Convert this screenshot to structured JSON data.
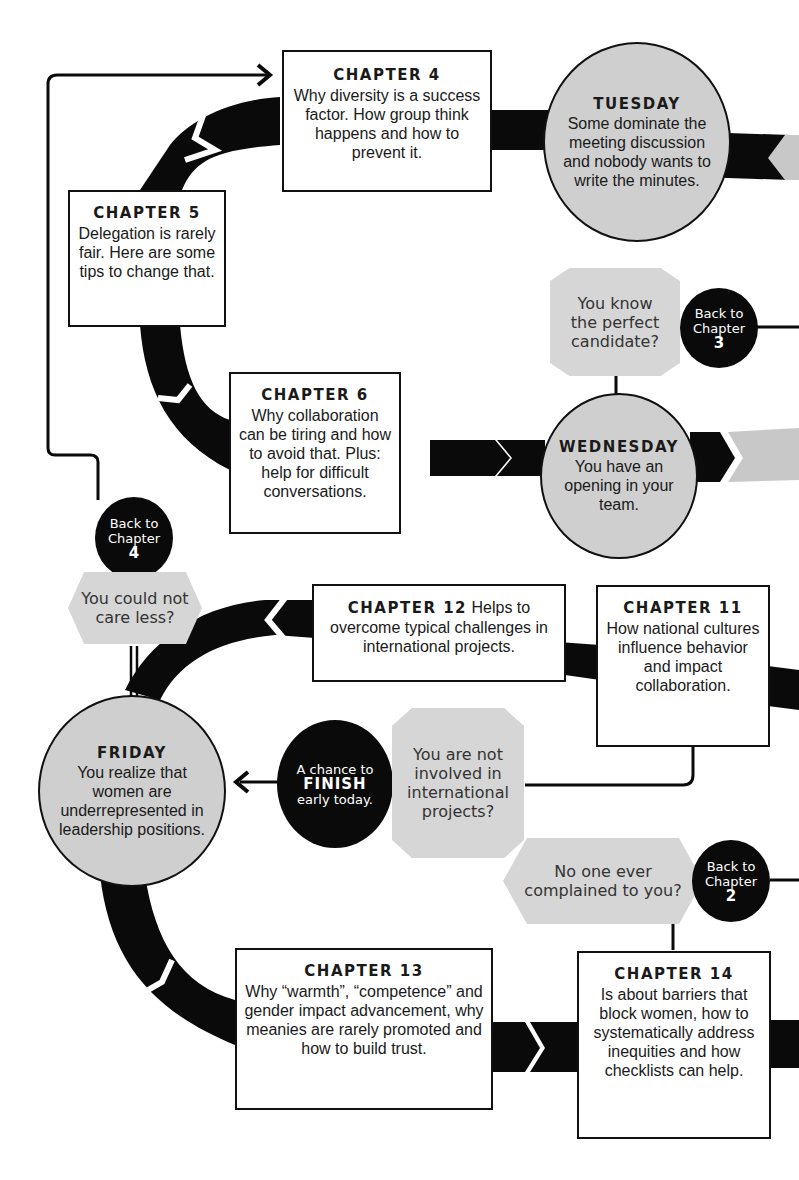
{
  "chapters": {
    "ch4": {
      "title": "CHAPTER 4",
      "text": "Why diversity is a success factor. How group think happens and how to prevent it."
    },
    "ch5": {
      "title": "CHAPTER 5",
      "text": "Delegation is rarely fair. Here are some tips to change that."
    },
    "ch6": {
      "title": "CHAPTER 6",
      "text": "Why collaboration can be tiring and how to avoid that. Plus: help for difficult conversations."
    },
    "ch11": {
      "title": "CHAPTER 11",
      "text": "How national cultures influence behavior and impact collaboration."
    },
    "ch12": {
      "title": "CHAPTER 12",
      "text": "Helps to overcome typical challenges in international projects."
    },
    "ch13": {
      "title": "CHAPTER 13",
      "text": "Why “warmth”, “competence” and gender impact advancement, why meanies are rarely promoted and how to build trust."
    },
    "ch14": {
      "title": "CHAPTER 14",
      "text": "Is about barriers that block women, how to systematically address inequities and how checklists can help."
    }
  },
  "days": {
    "tuesday": {
      "title": "TUESDAY",
      "text": "Some dominate the meeting discussion and nobody wants to write the minutes."
    },
    "wednesday": {
      "title": "WEDNESDAY",
      "text": "You have an opening in your team."
    },
    "friday": {
      "title": "FRIDAY",
      "text": "You realize that women are underrepresented in leadership positions."
    }
  },
  "questions": {
    "perfect_candidate": "You know the perfect candidate?",
    "could_not_care": "You could not care less?",
    "not_international": "You are not involved in international projects?",
    "no_complaints": "No one ever complained to you?"
  },
  "badges": {
    "back_ch3": {
      "line1": "Back to",
      "line2": "Chapter",
      "num": "3"
    },
    "back_ch4": {
      "line1": "Back to",
      "line2": "Chapter",
      "num": "4"
    },
    "back_ch2": {
      "line1": "Back to",
      "line2": "Chapter",
      "num": "2"
    },
    "finish": {
      "line1": "A chance to",
      "big": "FINISH",
      "line3": "early today."
    }
  },
  "colors": {
    "path": "#0a0a0a",
    "day_fill": "#cfcfcf",
    "question_fill": "#d6d6d6",
    "ghost_path": "#c8c8c8"
  }
}
